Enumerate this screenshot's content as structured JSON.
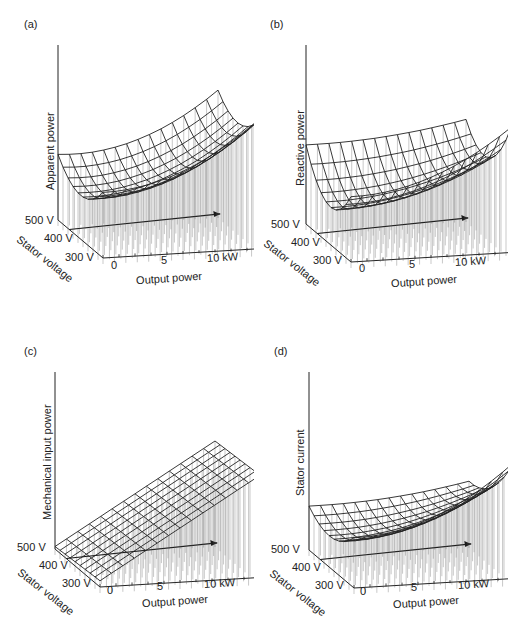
{
  "figure": {
    "caption_visible": ""
  },
  "chart_data": [
    {
      "panel": "(a)",
      "type": "surface3d",
      "title": "",
      "zlabel": "Apparent power",
      "xlabel": "Output power",
      "ylabel": "Stator voltage",
      "x_ticks": [
        "0",
        "5",
        "10 kW"
      ],
      "y_ticks": [
        "500 V",
        "400 V",
        "300 V"
      ],
      "x_range": [
        0,
        10
      ],
      "y_range": [
        300,
        500
      ],
      "description": "Bowl-shaped wireframe surface; minimum near mid output power and mid voltage, rising toward 10 kW and toward high/low voltage edges",
      "grid_rows": 9,
      "grid_cols": 14
    },
    {
      "panel": "(b)",
      "type": "surface3d",
      "zlabel": "Reactive power",
      "xlabel": "Output power",
      "ylabel": "Stator voltage",
      "x_ticks": [
        "0",
        "5",
        "10 kW"
      ],
      "y_ticks": [
        "500 V",
        "400 V",
        "300 V"
      ],
      "x_range": [
        0,
        10
      ],
      "y_range": [
        300,
        500
      ],
      "description": "Saddle/bowl wireframe surface; high at 500 V, dips to a minimum near 400 V, rises again at high output power",
      "grid_rows": 9,
      "grid_cols": 14
    },
    {
      "panel": "(c)",
      "type": "surface3d",
      "zlabel": "Mechanical input power",
      "xlabel": "Output power",
      "ylabel": "Stator voltage",
      "x_ticks": [
        "0",
        "5",
        "10 kW"
      ],
      "y_ticks": [
        "500 V",
        "400 V",
        "300 V"
      ],
      "x_range": [
        0,
        10
      ],
      "y_range": [
        300,
        500
      ],
      "description": "Nearly planar wireframe surface rising linearly with output power, almost independent of stator voltage",
      "grid_rows": 9,
      "grid_cols": 14
    },
    {
      "panel": "(d)",
      "type": "surface3d",
      "zlabel": "Stator current",
      "xlabel": "Output power",
      "ylabel": "Stator voltage",
      "x_ticks": [
        "0",
        "5",
        "10 kW"
      ],
      "y_ticks": [
        "500 V",
        "400 V",
        "300 V"
      ],
      "x_range": [
        0,
        10
      ],
      "y_range": [
        300,
        500
      ],
      "description": "Bowl-shaped wireframe surface; minimum around mid voltage at low output, rising steeply toward 10 kW at low voltage",
      "grid_rows": 9,
      "grid_cols": 14
    }
  ],
  "panels": [
    {
      "label": "(a)",
      "zlabel": "Apparent power",
      "xlabel": "Output power",
      "ylabel": "Stator voltage",
      "x0": "0",
      "x5": "5",
      "x10": "10 kW",
      "v500": "500 V",
      "v400": "400 V",
      "v300": "300 V"
    },
    {
      "label": "(b)",
      "zlabel": "Reactive power",
      "xlabel": "Output power",
      "ylabel": "Stator voltage",
      "x0": "0",
      "x5": "5",
      "x10": "10 kW",
      "v500": "500 V",
      "v400": "400 V",
      "v300": "300 V"
    },
    {
      "label": "(c)",
      "zlabel": "Mechanical input power",
      "xlabel": "Output power",
      "ylabel": "Stator voltage",
      "x0": "0",
      "x5": "5",
      "x10": "10 kW",
      "v500": "500 V",
      "v400": "400 V",
      "v300": "300 V"
    },
    {
      "label": "(d)",
      "zlabel": "Stator current",
      "xlabel": "Output power",
      "ylabel": "Stator voltage",
      "x0": "0",
      "x5": "5",
      "x10": "10 kW",
      "v500": "500 V",
      "v400": "400 V",
      "v300": "300 V"
    }
  ],
  "colors": {
    "line": "#222222",
    "stem": "#555555",
    "fill": "#bbbbbb"
  }
}
